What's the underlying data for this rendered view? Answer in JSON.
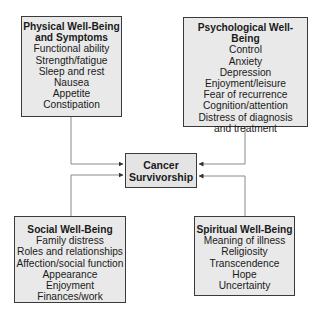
{
  "diagram": {
    "center": {
      "line1": "Cancer",
      "line2": "Survivorship"
    },
    "domains": {
      "physical": {
        "title_line1": "Physical Well-Being",
        "title_line2": "and Symptoms",
        "items": [
          "Functional ability",
          "Strength/fatigue",
          "Sleep and rest",
          "Nausea",
          "Appetite",
          "Constipation"
        ]
      },
      "psychological": {
        "title": "Psychological Well-Being",
        "items": [
          "Control",
          "Anxiety",
          "Depression",
          "Enjoyment/leisure",
          "Fear of recurrence",
          "Cognition/attention",
          "Distress of diagnosis",
          "and treatment"
        ]
      },
      "social": {
        "title": "Social Well-Being",
        "items": [
          "Family distress",
          "Roles and relationships",
          "Affection/social function",
          "Appearance",
          "Enjoyment",
          "Finances/work"
        ]
      },
      "spiritual": {
        "title": "Spiritual Well-Being",
        "items": [
          "Meaning of illness",
          "Religiosity",
          "Transcendence",
          "Hope",
          "Uncertainty"
        ]
      }
    },
    "colors": {
      "box_fill": "#e9e9e9",
      "box_border": "#3a3a3a",
      "connector": "#8a8a8a"
    }
  }
}
